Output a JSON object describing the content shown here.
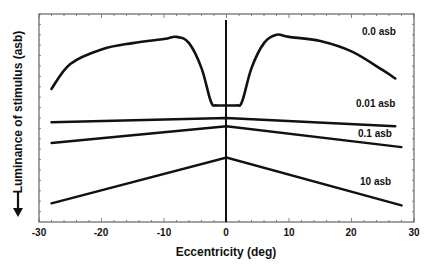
{
  "chart_data": {
    "type": "line",
    "title": "",
    "xlabel": "Eccentricity (deg)",
    "ylabel": "Luminance of stimulus (asb)",
    "ylabel_arrow": "down-arrow",
    "xlim": [
      -30,
      30
    ],
    "xticks": [
      -30,
      -20,
      -10,
      0,
      10,
      20,
      30
    ],
    "xtick_labels": [
      "-30",
      "-20",
      "-10",
      "0",
      "10",
      "20",
      "30"
    ],
    "grid": false,
    "y_axis_note": "Relative scale; no numeric y tick labels. Luminance increases downward (arrow). Values below are relative heights (0 = bottom of plot, 100 = top).",
    "vertical_reference_line_x": 0,
    "series": [
      {
        "name": "0.0 asb",
        "label": "0.0 asb",
        "x": [
          -28,
          -25,
          -20,
          -15,
          -10,
          -8,
          -6,
          -4,
          -2.5,
          -1.5,
          1.5,
          2.5,
          4,
          6,
          8,
          10,
          15,
          20,
          25,
          27
        ],
        "y": [
          64,
          76,
          83,
          86,
          88,
          89,
          86,
          74,
          58,
          56,
          56,
          58,
          74,
          86,
          90,
          89,
          87,
          82,
          73,
          69
        ]
      },
      {
        "name": "0.01 asb",
        "label": "0.01 asb",
        "x": [
          -28,
          0,
          27
        ],
        "y": [
          48,
          50,
          46
        ]
      },
      {
        "name": "0.1 asb",
        "label": "0.1 asb",
        "x": [
          -28,
          0,
          28
        ],
        "y": [
          38,
          46,
          36
        ]
      },
      {
        "name": "10 asb",
        "label": "10 asb",
        "x": [
          -28,
          0,
          28
        ],
        "y": [
          9,
          31,
          8
        ]
      }
    ]
  },
  "labels": {
    "xlabel": "Eccentricity (deg)",
    "ylabel": "Luminance of stimulus (asb)",
    "series0": "0.0 asb",
    "series1": "0.01 asb",
    "series2": "0.1 asb",
    "series3": "10 asb",
    "ticks": [
      "-30",
      "-20",
      "-10",
      "0",
      "10",
      "20",
      "30"
    ]
  }
}
